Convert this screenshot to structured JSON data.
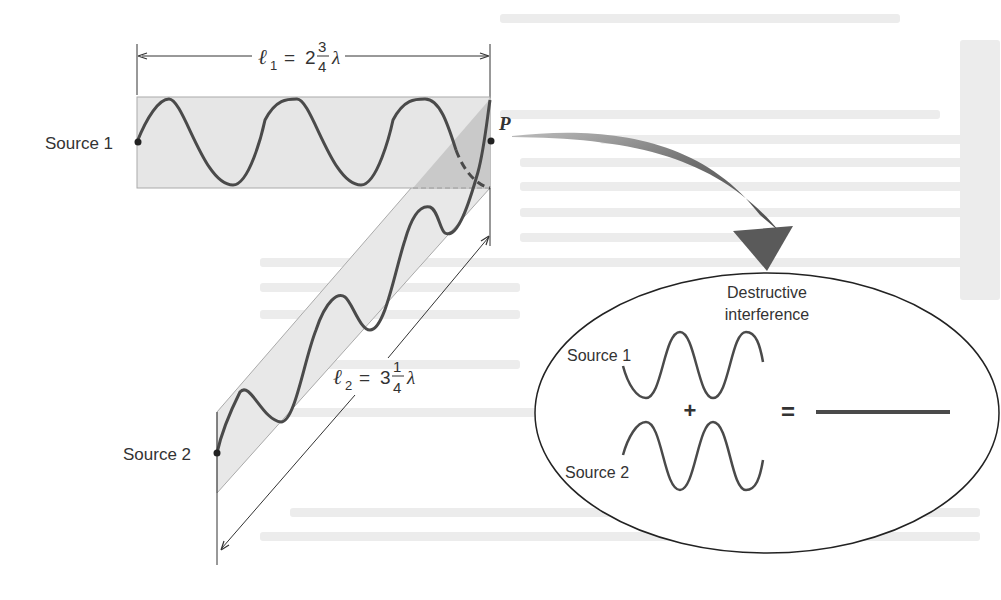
{
  "figure": {
    "type": "wave interference diagram",
    "path1": {
      "source_label": "Source 1",
      "length_symbol": "ℓ",
      "length_subscript": "1",
      "equals": "=",
      "whole": "2",
      "numerator": "3",
      "denominator": "4",
      "unit": "λ"
    },
    "path2": {
      "source_label": "Source 2",
      "length_symbol": "ℓ",
      "length_subscript": "2",
      "equals": "=",
      "whole": "3",
      "numerator": "1",
      "denominator": "4",
      "unit": "λ"
    },
    "point_label": "P",
    "inset": {
      "title_line1": "Destructive",
      "title_line2": "interference",
      "source1_label": "Source 1",
      "source2_label": "Source 2",
      "plus": "+",
      "equals": "=",
      "result": "flat line (zero amplitude)"
    },
    "colors": {
      "wave": "#4a4a4a",
      "band_fill": "#e6e6e6",
      "overlap_fill": "#c8c8c8",
      "arrow": "#6a6a6a",
      "line": "#333333"
    }
  }
}
